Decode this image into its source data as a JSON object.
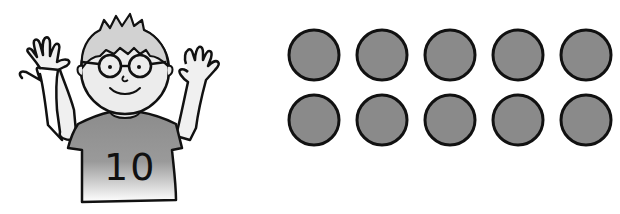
{
  "illustration": {
    "subject": "boy-with-hands-raised",
    "shirt_number": "10",
    "fingers_shown": 10
  },
  "counters": {
    "count": 10,
    "rows": 2,
    "per_row": 5,
    "fill_color": "#8a8a8a",
    "stroke_color": "#111111"
  },
  "colors": {
    "background": "#ffffff",
    "shirt": "#8c8c8c",
    "skin": "#e6e6e6",
    "hair": "#d0d0d0",
    "outline": "#111111"
  }
}
